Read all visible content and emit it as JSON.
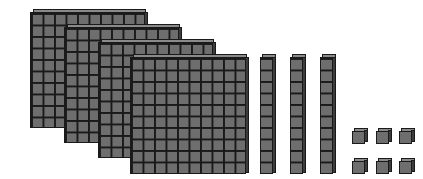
{
  "diagram": {
    "title": "Base-ten blocks",
    "represented_value": 436,
    "colors": {
      "block_fill": "#6e6e6e",
      "grid_lines": "#1a1a1a",
      "top_face": "#8a8a8a",
      "side_face": "#3c3c3c",
      "background": "#ffffff"
    },
    "flats": {
      "count": 4,
      "label": "hundreds",
      "grid": "10x10"
    },
    "rods": {
      "count": 3,
      "label": "tens",
      "grid": "1x10"
    },
    "units": {
      "count": 6,
      "label": "ones",
      "arrangement": "2 rows x 3 columns"
    }
  }
}
